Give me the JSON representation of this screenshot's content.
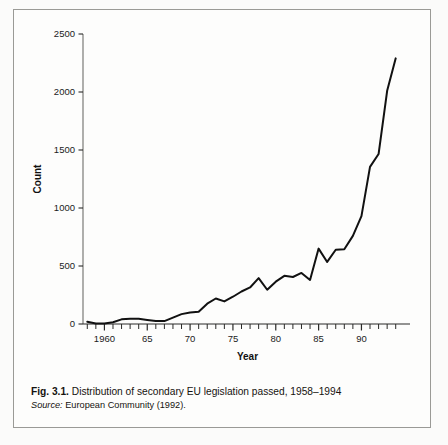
{
  "figure": {
    "caption_number": "Fig. 3.1.",
    "caption_text": "Distribution of secondary EU legislation passed, 1958–1994",
    "source_label": "Source:",
    "source_text": "European Community (1992).",
    "frame_color": "#9a9a96",
    "line_color": "#111111",
    "background": "#fdfdfc"
  },
  "chart_data": {
    "type": "line",
    "title": "",
    "xlabel": "Year",
    "ylabel": "Count",
    "xlim": [
      1957.5,
      1994.5
    ],
    "ylim": [
      0,
      2500
    ],
    "grid": false,
    "legend": false,
    "y_ticks": [
      0,
      500,
      1000,
      1500,
      2000,
      2500
    ],
    "y_tick_labels": [
      "0",
      "500",
      "1000",
      "1500",
      "2000",
      "2500"
    ],
    "x_ticks": [
      1960,
      1965,
      1970,
      1975,
      1980,
      1985,
      1990
    ],
    "x_tick_labels": [
      "1960",
      "65",
      "70",
      "75",
      "80",
      "85",
      "90"
    ],
    "x_minor_tick_step": 1,
    "x": [
      1958,
      1959,
      1960,
      1961,
      1962,
      1963,
      1964,
      1965,
      1966,
      1967,
      1968,
      1969,
      1970,
      1971,
      1972,
      1973,
      1974,
      1975,
      1976,
      1977,
      1978,
      1979,
      1980,
      1981,
      1982,
      1983,
      1984,
      1985,
      1986,
      1987,
      1988,
      1989,
      1990,
      1991,
      1992,
      1993,
      1994
    ],
    "values": [
      20,
      5,
      5,
      15,
      40,
      45,
      45,
      35,
      25,
      25,
      55,
      85,
      100,
      105,
      175,
      220,
      195,
      235,
      280,
      315,
      395,
      295,
      365,
      415,
      405,
      440,
      380,
      650,
      535,
      640,
      645,
      760,
      930,
      1355,
      1465,
      2010,
      2290
    ],
    "series": [
      {
        "name": "Secondary EU legislation passed",
        "values": [
          20,
          5,
          5,
          15,
          40,
          45,
          45,
          35,
          25,
          25,
          55,
          85,
          100,
          105,
          175,
          220,
          195,
          235,
          280,
          315,
          395,
          295,
          365,
          415,
          405,
          440,
          380,
          650,
          535,
          640,
          645,
          760,
          930,
          1355,
          1465,
          2010,
          2290
        ]
      }
    ]
  }
}
